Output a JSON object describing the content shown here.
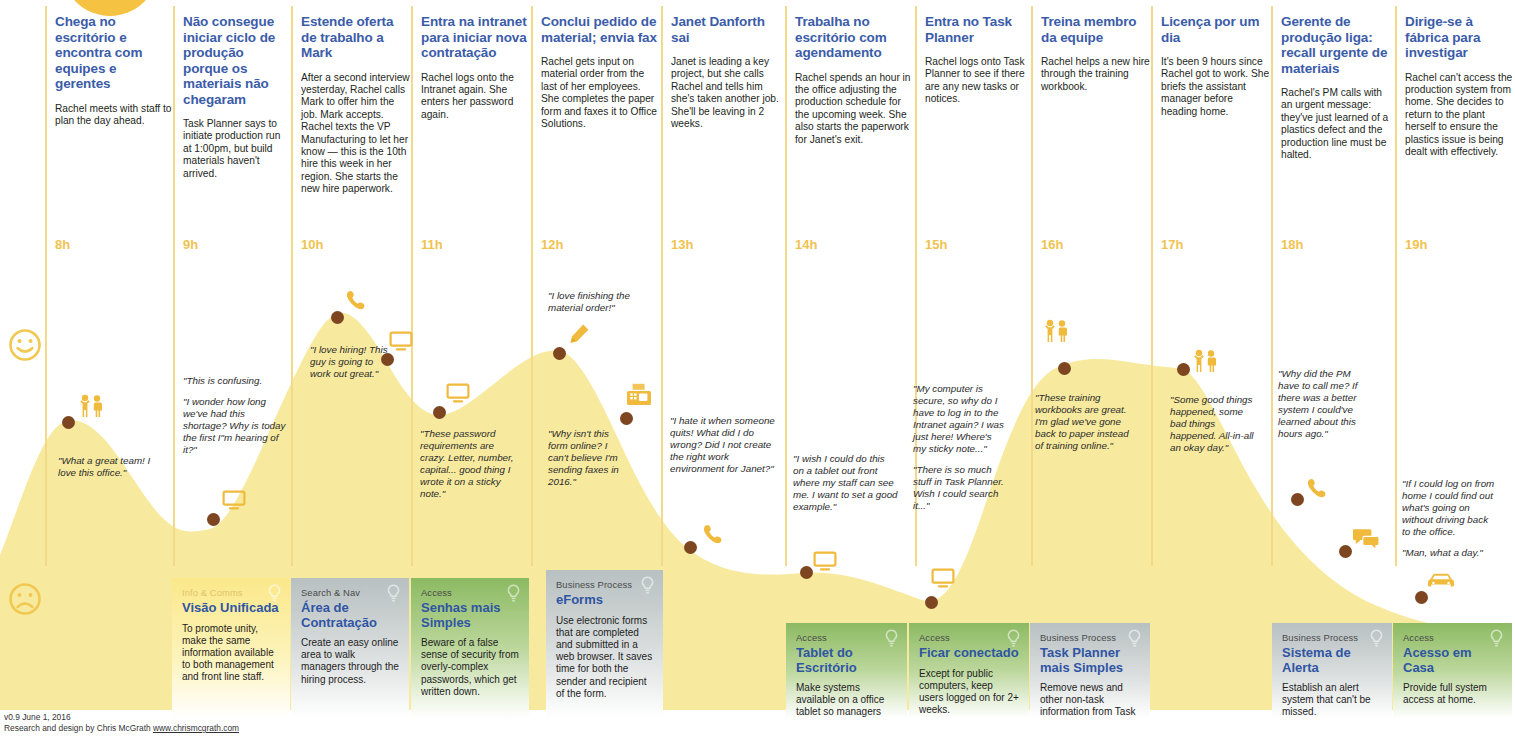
{
  "meta": {
    "footer_line1": "v0.9 June 1, 2016",
    "footer_line2_prefix": "Research and design by Chris McGrath",
    "footer_link": "www.chrismcgrath.com"
  },
  "legend": {
    "happy_icon": "happy-face-icon",
    "sad_icon": "sad-face-icon"
  },
  "colors": {
    "curve_fill": "#f7ea9e",
    "hour_label": "#f0c350",
    "stage_title": "#3b5ca8",
    "opportunity_title": "#2f55a4",
    "touchpoint_dot": "#7d4520",
    "icon_yellow": "#f0ba3c",
    "card_yellow": "#fbe88a",
    "card_gray": "#b8c0c1",
    "card_green": "#8cba62"
  },
  "columns": [
    {
      "hour": "8h",
      "title": "Chega no escritório e encontra com equipes e gerentes",
      "body": "Rachel meets with staff to plan the day ahead."
    },
    {
      "hour": "9h",
      "title": "Não consegue iniciar ciclo de produção porque os materiais não chegaram",
      "body": "Task Planner says to initiate production run at 1:00pm, but build materials haven't arrived."
    },
    {
      "hour": "10h",
      "title": "Estende oferta de trabalho a Mark",
      "body": "After a second interview yesterday, Rachel calls Mark to offer him the job. Mark accepts. Rachel texts the VP Manufacturing to let her know — this is the 10th hire this week in her region. She starts the new hire paperwork."
    },
    {
      "hour": "11h",
      "title": "Entra na intranet para iniciar nova contratação",
      "body": "Rachel logs onto the Intranet again. She enters her password again."
    },
    {
      "hour": "12h",
      "title": "Conclui pedido de material; envia fax",
      "body": "Rachel gets input on material order from the last of her employees. She completes the paper form and faxes it to Office Solutions."
    },
    {
      "hour": "13h",
      "title": "Janet Danforth sai",
      "body": "Janet is leading a key project, but she calls Rachel and tells him she's taken another job. She'll be leaving in 2 weeks."
    },
    {
      "hour": "14h",
      "title": "Trabalha no escritório com agendamento",
      "body": "Rachel spends an hour in the office adjusting the production schedule for the upcoming week. She also starts the paperwork for Janet's exit."
    },
    {
      "hour": "15h",
      "title": "Entra no Task Planner",
      "body": "Rachel logs onto Task Planner to see if there are any new tasks or notices."
    },
    {
      "hour": "16h",
      "title": "Treina membro da equipe",
      "body": "Rachel helps a new hire through the training workbook."
    },
    {
      "hour": "17h",
      "title": "Licença por um dia",
      "body": "It's been 9 hours since Rachel got to work. She briefs the assistant manager before heading home."
    },
    {
      "hour": "18h",
      "title": "Gerente de produção liga: recall urgente de materiais",
      "body": "Rachel's PM calls with an urgent message: they've just learned of a plastics defect and the production line must be halted."
    },
    {
      "hour": "19h",
      "title": "Dirige-se à fábrica para investigar",
      "body": "Rachel can't access the production system from home. She decides to return to the plant herself to ensure the plastics issue is being dealt with effectively."
    }
  ],
  "quotes": [
    {
      "x": 58,
      "y": 455,
      "w": 100,
      "lines": [
        "\"What a great team! I love this office.\""
      ]
    },
    {
      "x": 183,
      "y": 375,
      "w": 104,
      "lines": [
        "\"This is confusing.",
        "\"I wonder how long we've had this shortage? Why is today the first I\"m hearing of it?\""
      ]
    },
    {
      "x": 310,
      "y": 344,
      "w": 78,
      "lines": [
        "\"I love hiring! This guy is going to work out great.\""
      ]
    },
    {
      "x": 420,
      "y": 428,
      "w": 100,
      "lines": [
        "\"These password requirements are crazy. Letter, number, capital... good thing I wrote it on a sticky note.\""
      ]
    },
    {
      "x": 548,
      "y": 290,
      "w": 110,
      "lines": [
        "\"I love finishing the material order!\""
      ]
    },
    {
      "x": 548,
      "y": 428,
      "w": 80,
      "lines": [
        "\"Why isn't this form online? I can't believe I'm sending faxes in 2016.\""
      ]
    },
    {
      "x": 670,
      "y": 415,
      "w": 110,
      "lines": [
        "\"I hate it when someone quits! What did I do wrong?  Did I not create the right work environment for Janet?\""
      ]
    },
    {
      "x": 793,
      "y": 453,
      "w": 105,
      "lines": [
        "\"I wish I could do this on a tablet out front where my staff can see me. I want to set a good example.\""
      ]
    },
    {
      "x": 913,
      "y": 383,
      "w": 92,
      "lines": [
        "\"My computer is secure, so why do I have to log in to the Intranet again? I was just here! Where's my sticky note...\"",
        "\"There is so much stuff in Task Planner.\nWish I could search it...\""
      ]
    },
    {
      "x": 1035,
      "y": 392,
      "w": 103,
      "lines": [
        "\"These training workbooks are great. I'm glad we've gone back to paper instead of training online.\""
      ]
    },
    {
      "x": 1170,
      "y": 394,
      "w": 92,
      "lines": [
        "\"Some good things happened, some bad things happened. All-in-all an okay day.\""
      ]
    },
    {
      "x": 1278,
      "y": 368,
      "w": 94,
      "lines": [
        "\"Why did the PM have to call me? If there was a better system I could've learned about this hours ago.\""
      ]
    },
    {
      "x": 1402,
      "y": 478,
      "w": 96,
      "lines": [
        "\"If I could log on from home I could find out what's going on without driving back to the office.",
        "\"Man, what a day.\""
      ]
    }
  ],
  "touchpoints": [
    {
      "x": 62,
      "y": 416,
      "icon": "people-icon",
      "ix": 78,
      "iy": 394
    },
    {
      "x": 207,
      "y": 513,
      "icon": "monitor-icon",
      "ix": 222,
      "iy": 490
    },
    {
      "x": 331,
      "y": 311,
      "icon": "phone-icon",
      "ix": 345,
      "iy": 289
    },
    {
      "x": 381,
      "y": 353,
      "icon": "monitor-icon",
      "ix": 389,
      "iy": 331
    },
    {
      "x": 433,
      "y": 406,
      "icon": "monitor-icon",
      "ix": 446,
      "iy": 383
    },
    {
      "x": 553,
      "y": 347,
      "icon": "pencil-icon",
      "ix": 568,
      "iy": 323
    },
    {
      "x": 620,
      "y": 412,
      "icon": "fax-icon",
      "ix": 627,
      "iy": 383
    },
    {
      "x": 684,
      "y": 541,
      "icon": "phone-icon",
      "ix": 702,
      "iy": 523
    },
    {
      "x": 800,
      "y": 566,
      "icon": "monitor-icon",
      "ix": 813,
      "iy": 551
    },
    {
      "x": 925,
      "y": 596,
      "icon": "monitor-icon",
      "ix": 931,
      "iy": 568
    },
    {
      "x": 1058,
      "y": 362,
      "icon": "people-icon",
      "ix": 1043,
      "iy": 319
    },
    {
      "x": 1177,
      "y": 363,
      "icon": "people-icon",
      "ix": 1192,
      "iy": 349
    },
    {
      "x": 1291,
      "y": 493,
      "icon": "phone-icon",
      "ix": 1306,
      "iy": 477
    },
    {
      "x": 1339,
      "y": 545,
      "icon": "chat-icon",
      "ix": 1353,
      "iy": 528
    },
    {
      "x": 1415,
      "y": 591,
      "icon": "car-icon",
      "ix": 1428,
      "iy": 573
    }
  ],
  "opportunities": [
    {
      "x": 172,
      "y": 578,
      "w": 118,
      "h": 140,
      "theme": "yellow",
      "category": "Info & Comms",
      "title": "Visão Unificada",
      "body": "To promote unity, make the same information available to both management and front line staff."
    },
    {
      "x": 291,
      "y": 578,
      "w": 118,
      "h": 140,
      "theme": "gray",
      "category": "Search & Nav",
      "title": "Área de Contratação",
      "body": "Create an easy online area to walk managers through the hiring process."
    },
    {
      "x": 411,
      "y": 578,
      "w": 118,
      "h": 140,
      "theme": "green",
      "category": "Access",
      "title": "Senhas mais Simples",
      "body": "Beware of a false sense of security from overly-complex passwords, which get written down."
    },
    {
      "x": 546,
      "y": 570,
      "w": 117,
      "h": 148,
      "theme": "gray",
      "category": "Business Process",
      "title": "eForms",
      "body": "Use electronic forms that are completed and submitted in a web browser. It saves time for both the sender and recipient of the form."
    },
    {
      "x": 786,
      "y": 623,
      "w": 121,
      "h": 95,
      "theme": "green",
      "category": "Access",
      "title": "Tablet do Escritório",
      "body": "Make systems available on a office tablet so managers don't have to go to their office."
    },
    {
      "x": 909,
      "y": 623,
      "w": 120,
      "h": 95,
      "theme": "green",
      "category": "Access",
      "title": "Ficar conectado",
      "body": "Except for public computers, keep users logged on for 2+ weeks."
    },
    {
      "x": 1030,
      "y": 623,
      "w": 120,
      "h": 95,
      "theme": "gray",
      "category": "Business Process",
      "title": "Task Planner mais Simples",
      "body": "Remove news and other non-task information from Task Planner."
    },
    {
      "x": 1272,
      "y": 623,
      "w": 120,
      "h": 95,
      "theme": "gray",
      "category": "Business Process",
      "title": "Sistema de Alerta",
      "body": "Establish an alert system that can't be missed."
    },
    {
      "x": 1393,
      "y": 623,
      "w": 119,
      "h": 95,
      "theme": "green",
      "category": "Access",
      "title": "Acesso em Casa",
      "body": "Provide full system access at home."
    }
  ],
  "chart_data": {
    "type": "area",
    "xlabel": "Hour of day",
    "ylabel": "Emotion (happy to sad)",
    "x": [
      "8h",
      "9h",
      "10h",
      "11h",
      "12h",
      "13h",
      "14h",
      "15h",
      "16h",
      "17h",
      "18h",
      "19h"
    ],
    "values": [
      0.55,
      0.18,
      0.78,
      0.4,
      0.72,
      0.24,
      0.12,
      0.1,
      0.7,
      0.68,
      0.34,
      0.12
    ],
    "ylim": [
      0,
      1
    ],
    "grid": false
  }
}
